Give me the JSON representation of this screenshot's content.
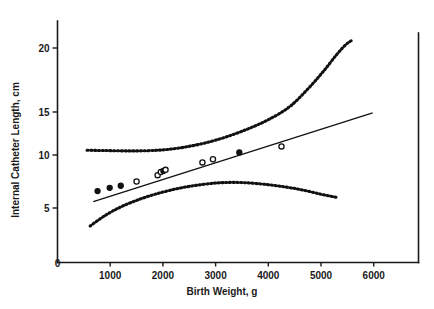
{
  "figure": {
    "kind": "scatter-with-regression",
    "background": "#ffffff",
    "ink_color": "#111111"
  },
  "chart_data": {
    "type": "scatter",
    "title": "",
    "subtitle": "",
    "xlabel": "Birth Weight, g",
    "ylabel": "Internal Catheter Length, cm",
    "xlim": [
      0,
      6850
    ],
    "ylim": [
      0,
      22.4
    ],
    "xticks": [
      0,
      1000,
      2000,
      3000,
      4000,
      5000,
      6000
    ],
    "xticklabels": [
      "0",
      "1000",
      "2000",
      "3000",
      "4000",
      "5000",
      "6000"
    ],
    "yticks": [
      5,
      10,
      15,
      20
    ],
    "yticklabels": [
      "5",
      "10",
      "15",
      "20"
    ],
    "grid": false,
    "legend": null,
    "legend_position": "none",
    "axis_style": "left-and-bottom-spines-plus-right-spine",
    "series": [
      {
        "name": "Observed infants",
        "marker": "circle",
        "values": [
          {
            "x": 760,
            "y": 6.6,
            "filled": true
          },
          {
            "x": 990,
            "y": 6.9,
            "filled": true
          },
          {
            "x": 1200,
            "y": 7.1,
            "filled": true
          },
          {
            "x": 1500,
            "y": 7.5,
            "filled": false
          },
          {
            "x": 1900,
            "y": 8.1,
            "filled": false
          },
          {
            "x": 1960,
            "y": 8.4,
            "filled": false
          },
          {
            "x": 2010,
            "y": 8.5,
            "filled": true
          },
          {
            "x": 2050,
            "y": 8.6,
            "filled": false
          },
          {
            "x": 2750,
            "y": 9.3,
            "filled": false
          },
          {
            "x": 2950,
            "y": 9.6,
            "filled": false
          },
          {
            "x": 3450,
            "y": 10.3,
            "filled": true
          },
          {
            "x": 4250,
            "y": 11.0,
            "filled": false
          }
        ]
      }
    ],
    "regression_line": {
      "name": "Least-squares regression line",
      "style": "solid",
      "x_start": 680,
      "y_start": 5.6,
      "x_end": 5980,
      "y_end": 14.9
    },
    "confidence_bands": [
      {
        "name": "Upper prediction limit",
        "style": "dotted",
        "points": [
          {
            "x": 560,
            "y": 10.55
          },
          {
            "x": 900,
            "y": 10.52
          },
          {
            "x": 1300,
            "y": 10.48
          },
          {
            "x": 1700,
            "y": 10.5
          },
          {
            "x": 2050,
            "y": 10.62
          },
          {
            "x": 2400,
            "y": 10.9
          },
          {
            "x": 2800,
            "y": 11.4
          },
          {
            "x": 3200,
            "y": 12.1
          },
          {
            "x": 3600,
            "y": 13.0
          },
          {
            "x": 4000,
            "y": 14.1
          },
          {
            "x": 4400,
            "y": 15.4
          },
          {
            "x": 4750,
            "y": 16.8
          },
          {
            "x": 5050,
            "y": 18.2
          },
          {
            "x": 5300,
            "y": 19.5
          },
          {
            "x": 5480,
            "y": 20.6
          },
          {
            "x": 5600,
            "y": 21.3
          }
        ]
      },
      {
        "name": "Lower prediction limit",
        "style": "dotted",
        "points": [
          {
            "x": 620,
            "y": 3.35
          },
          {
            "x": 900,
            "y": 4.3
          },
          {
            "x": 1200,
            "y": 5.1
          },
          {
            "x": 1600,
            "y": 5.9
          },
          {
            "x": 2000,
            "y": 6.5
          },
          {
            "x": 2400,
            "y": 6.95
          },
          {
            "x": 2800,
            "y": 7.25
          },
          {
            "x": 3150,
            "y": 7.4
          },
          {
            "x": 3500,
            "y": 7.4
          },
          {
            "x": 3900,
            "y": 7.25
          },
          {
            "x": 4300,
            "y": 7.0
          },
          {
            "x": 4650,
            "y": 6.7
          },
          {
            "x": 5000,
            "y": 6.3
          },
          {
            "x": 5300,
            "y": 6.0
          }
        ]
      }
    ]
  }
}
